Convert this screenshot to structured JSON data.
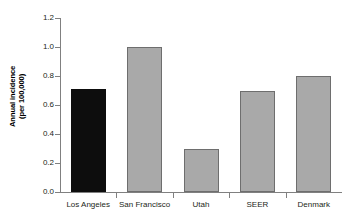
{
  "chart_data": {
    "type": "bar",
    "title": "",
    "subtitle": "",
    "xlabel": "",
    "ylabel": "Annual incidence\n(per 100,000)",
    "ylabel_line1": "Annual incidence",
    "ylabel_line2": "(per 100,000)",
    "categories": [
      "Los Angeles",
      "San Francisco",
      "Utah",
      "SEER",
      "Denmark"
    ],
    "values": [
      0.71,
      1.0,
      0.3,
      0.7,
      0.8
    ],
    "bar_colors": [
      "#0d0d0d",
      "#a9a9a9",
      "#a9a9a9",
      "#a9a9a9",
      "#a9a9a9"
    ],
    "ylim": [
      0.0,
      1.2
    ],
    "ytick_labels": [
      "0.0",
      "0.2",
      "0.4",
      "0.6",
      "0.8",
      "1.0",
      "1.2"
    ],
    "ytick_values": [
      0.0,
      0.2,
      0.4,
      0.6,
      0.8,
      1.0,
      1.2
    ],
    "grid": false,
    "legend": null,
    "legend_position": "none",
    "annotations": []
  },
  "colors": {
    "highlight_bar": "#0d0d0d",
    "default_bar": "#a9a9a9",
    "bar_border": "#6e6e6e",
    "axis": "#808080",
    "text": "#231f20",
    "background": "#ffffff"
  }
}
